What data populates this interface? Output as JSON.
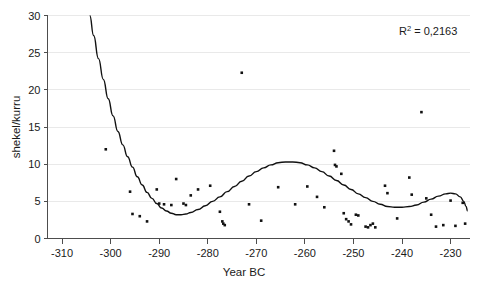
{
  "chart_data": {
    "type": "scatter",
    "title": "",
    "xlabel": "Year BC",
    "ylabel": "shekel/kurru",
    "xlim": [
      -313,
      -226
    ],
    "ylim": [
      0,
      30
    ],
    "xticks": [
      -310,
      -300,
      -290,
      -280,
      -270,
      -260,
      -250,
      -240,
      -230
    ],
    "xtick_labels": [
      "-310",
      "-300",
      "-290",
      "-280",
      "-270",
      "-260",
      "-250",
      "-240",
      "-230"
    ],
    "yticks": [
      0,
      5,
      10,
      15,
      20,
      25,
      30
    ],
    "ytick_labels": [
      "0",
      "5",
      "10",
      "15",
      "20",
      "25",
      "30"
    ],
    "grid": true,
    "grid_axis": "y",
    "legend": false,
    "marker_color": "#111111",
    "curve_color": "#111111",
    "grid_color": "#e9e9e9",
    "axis_color": "#4d4d4d",
    "annotations": [
      {
        "name": "r-squared",
        "text": "R2 = 0,2163",
        "display_prefix": "R",
        "display_sup": "2",
        "display_suffix": " = 0,2163",
        "x": -234,
        "y": 27.2
      }
    ],
    "series": [
      {
        "name": "observations",
        "type": "scatter",
        "points": [
          [
            -301.0,
            12.0
          ],
          [
            -296.0,
            6.3
          ],
          [
            -295.5,
            3.3
          ],
          [
            -294.0,
            3.0
          ],
          [
            -292.5,
            2.3
          ],
          [
            -290.5,
            6.6
          ],
          [
            -290.0,
            4.7
          ],
          [
            -289.0,
            4.6
          ],
          [
            -287.5,
            4.5
          ],
          [
            -286.5,
            8.0
          ],
          [
            -285.0,
            4.7
          ],
          [
            -284.5,
            4.5
          ],
          [
            -283.5,
            5.8
          ],
          [
            -282.0,
            6.6
          ],
          [
            -279.5,
            7.1
          ],
          [
            -277.5,
            3.6
          ],
          [
            -277.0,
            2.3
          ],
          [
            -276.8,
            2.0
          ],
          [
            -276.5,
            1.8
          ],
          [
            -273.0,
            22.3
          ],
          [
            -271.5,
            4.6
          ],
          [
            -269.0,
            2.4
          ],
          [
            -265.5,
            6.9
          ],
          [
            -262.0,
            4.6
          ],
          [
            -259.5,
            7.0
          ],
          [
            -257.5,
            5.6
          ],
          [
            -256.0,
            4.2
          ],
          [
            -254.0,
            11.8
          ],
          [
            -253.8,
            9.9
          ],
          [
            -253.5,
            9.7
          ],
          [
            -252.5,
            8.7
          ],
          [
            -252.0,
            3.4
          ],
          [
            -251.5,
            2.6
          ],
          [
            -251.0,
            2.3
          ],
          [
            -250.5,
            1.9
          ],
          [
            -249.5,
            3.2
          ],
          [
            -249.0,
            3.1
          ],
          [
            -247.5,
            1.6
          ],
          [
            -247.0,
            1.5
          ],
          [
            -246.5,
            1.8
          ],
          [
            -246.0,
            2.0
          ],
          [
            -245.5,
            1.5
          ],
          [
            -243.5,
            7.1
          ],
          [
            -243.0,
            6.1
          ],
          [
            -241.0,
            2.7
          ],
          [
            -238.5,
            8.2
          ],
          [
            -238.0,
            5.9
          ],
          [
            -236.0,
            17.0
          ],
          [
            -235.0,
            5.4
          ],
          [
            -234.0,
            3.2
          ],
          [
            -233.0,
            1.6
          ],
          [
            -231.5,
            1.8
          ],
          [
            -230.0,
            5.1
          ],
          [
            -229.0,
            1.7
          ],
          [
            -227.5,
            4.8
          ],
          [
            -227.0,
            2.0
          ]
        ]
      },
      {
        "name": "polynomial-trend",
        "type": "line",
        "r_squared": 0.2163,
        "points": [
          [
            -304.3,
            30.0
          ],
          [
            -303.5,
            27.3
          ],
          [
            -302.5,
            24.2
          ],
          [
            -301.5,
            21.4
          ],
          [
            -300.5,
            18.8
          ],
          [
            -299.5,
            16.5
          ],
          [
            -298.5,
            14.4
          ],
          [
            -297.5,
            12.6
          ],
          [
            -296.5,
            11.0
          ],
          [
            -295.5,
            9.6
          ],
          [
            -294.5,
            8.3
          ],
          [
            -293.5,
            7.2
          ],
          [
            -292.5,
            6.2
          ],
          [
            -291.5,
            5.4
          ],
          [
            -290.5,
            4.7
          ],
          [
            -289.5,
            4.1
          ],
          [
            -288.5,
            3.7
          ],
          [
            -287.5,
            3.4
          ],
          [
            -286.5,
            3.2
          ],
          [
            -285.5,
            3.2
          ],
          [
            -284.5,
            3.3
          ],
          [
            -283.5,
            3.5
          ],
          [
            -282.0,
            3.9
          ],
          [
            -280.5,
            4.4
          ],
          [
            -279.0,
            5.0
          ],
          [
            -277.5,
            5.6
          ],
          [
            -276.0,
            6.3
          ],
          [
            -274.5,
            7.0
          ],
          [
            -273.0,
            7.7
          ],
          [
            -271.5,
            8.4
          ],
          [
            -270.0,
            9.0
          ],
          [
            -268.5,
            9.5
          ],
          [
            -267.0,
            9.9
          ],
          [
            -265.5,
            10.2
          ],
          [
            -264.0,
            10.3
          ],
          [
            -262.5,
            10.3
          ],
          [
            -261.0,
            10.2
          ],
          [
            -259.5,
            9.9
          ],
          [
            -258.0,
            9.5
          ],
          [
            -256.5,
            9.0
          ],
          [
            -255.0,
            8.4
          ],
          [
            -253.5,
            7.8
          ],
          [
            -252.0,
            7.2
          ],
          [
            -250.5,
            6.6
          ],
          [
            -249.0,
            6.0
          ],
          [
            -247.5,
            5.5
          ],
          [
            -246.0,
            5.0
          ],
          [
            -244.5,
            4.6
          ],
          [
            -243.0,
            4.3
          ],
          [
            -241.5,
            4.2
          ],
          [
            -240.0,
            4.2
          ],
          [
            -238.5,
            4.3
          ],
          [
            -237.0,
            4.5
          ],
          [
            -235.5,
            4.9
          ],
          [
            -234.0,
            5.3
          ],
          [
            -232.5,
            5.7
          ],
          [
            -231.0,
            6.0
          ],
          [
            -230.0,
            6.1
          ],
          [
            -229.0,
            6.0
          ],
          [
            -228.0,
            5.6
          ],
          [
            -227.3,
            5.0
          ],
          [
            -226.8,
            4.3
          ],
          [
            -226.5,
            3.7
          ]
        ]
      }
    ]
  }
}
